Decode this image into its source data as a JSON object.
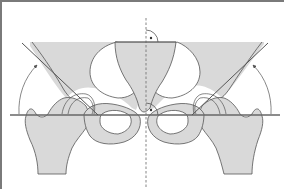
{
  "diagram": {
    "colors": {
      "background": "#ffffff",
      "bone_fill": "#d9d9d9",
      "outline": "#555555",
      "reference_line": "#666666",
      "frame": "#7a7a7a"
    },
    "elements": {
      "horizontal_reference_line": "interteardrop-line",
      "vertical_midline": "dashed-midline",
      "left_acetabular_line": "left-acetabular-tangent",
      "right_acetabular_line": "right-acetabular-tangent",
      "left_angle_arc": "left-angle-arc-arrow",
      "right_angle_arc": "right-angle-arc-arrow",
      "right_angle_markers": [
        "top-right-angle-marker",
        "bottom-right-angle-marker"
      ]
    }
  }
}
